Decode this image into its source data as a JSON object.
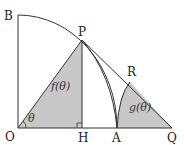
{
  "figure": {
    "points": {
      "B": "B",
      "P": "P",
      "R": "R",
      "O": "O",
      "H": "H",
      "A": "A",
      "Q": "Q"
    },
    "angle_label": "θ",
    "regions": {
      "f": "f(θ)",
      "g": "g(θ)"
    },
    "colors": {
      "shade": "#c8c8c8",
      "line": "#333333"
    }
  }
}
